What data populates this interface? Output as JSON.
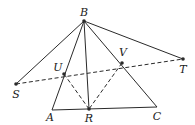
{
  "diagram": {
    "points": {
      "B": {
        "label": "B",
        "x": 84,
        "y": 21,
        "lx": 84,
        "ly": 16
      },
      "S": {
        "label": "S",
        "x": 16,
        "y": 84,
        "lx": 16,
        "ly": 98
      },
      "T": {
        "label": "T",
        "x": 183,
        "y": 59,
        "lx": 183,
        "ly": 73
      },
      "U": {
        "label": "U",
        "x": 64,
        "y": 74,
        "lx": 58,
        "ly": 71
      },
      "V": {
        "label": "V",
        "x": 122,
        "y": 63,
        "lx": 123,
        "ly": 56
      },
      "A": {
        "label": "A",
        "x": 52,
        "y": 110,
        "lx": 50,
        "ly": 121
      },
      "R": {
        "label": "R",
        "x": 89,
        "y": 109,
        "lx": 89,
        "ly": 122
      },
      "C": {
        "label": "C",
        "x": 157,
        "y": 107,
        "lx": 157,
        "ly": 120
      }
    },
    "solid_segments": [
      [
        "B",
        "S"
      ],
      [
        "B",
        "T"
      ],
      [
        "B",
        "A"
      ],
      [
        "B",
        "R"
      ],
      [
        "B",
        "C"
      ],
      [
        "A",
        "C"
      ]
    ],
    "dashed_segments": [
      [
        "S",
        "T"
      ],
      [
        "U",
        "R"
      ],
      [
        "V",
        "R"
      ]
    ],
    "dot_points": [
      "B",
      "S",
      "T",
      "U",
      "V",
      "R"
    ],
    "stroke_color": "#2a2a2a"
  }
}
